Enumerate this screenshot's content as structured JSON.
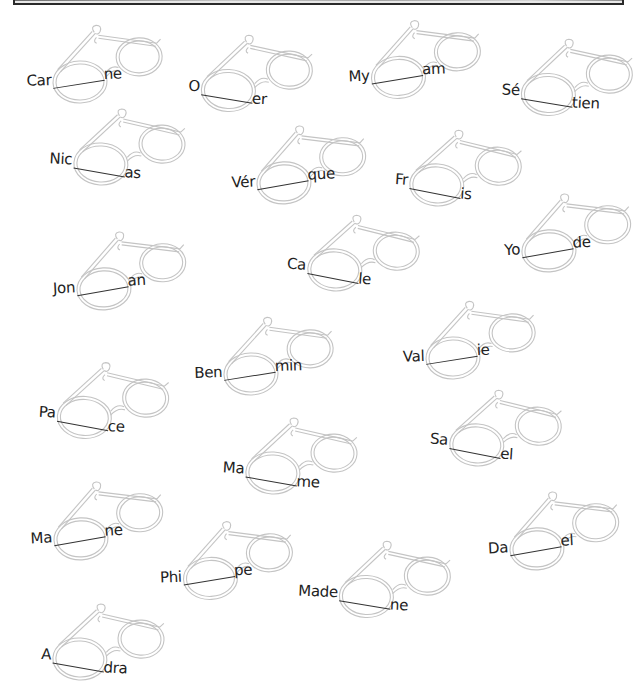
{
  "worksheet": {
    "header_bar": "decorative-title-bar",
    "items": [
      {
        "prefix": "Car",
        "suffix": "ne",
        "x": 22,
        "y": 48,
        "rot": -4
      },
      {
        "prefix": "O",
        "suffix": "er",
        "x": 175,
        "y": 52,
        "rot": 5
      },
      {
        "prefix": "My",
        "suffix": "am",
        "x": 340,
        "y": 44,
        "rot": -5
      },
      {
        "prefix": "Sé",
        "suffix": "tien",
        "x": 495,
        "y": 56,
        "rot": 5
      },
      {
        "prefix": "Nic",
        "suffix": "as",
        "x": 48,
        "y": 125,
        "rot": 6
      },
      {
        "prefix": "Vér",
        "suffix": "que",
        "x": 225,
        "y": 150,
        "rot": -6
      },
      {
        "prefix": "Fr",
        "suffix": "is",
        "x": 385,
        "y": 145,
        "rot": 8
      },
      {
        "prefix": "Jon",
        "suffix": "an",
        "x": 45,
        "y": 256,
        "rot": -6
      },
      {
        "prefix": "Ca",
        "suffix": "le",
        "x": 283,
        "y": 230,
        "rot": 8
      },
      {
        "prefix": "Yo",
        "suffix": "de",
        "x": 490,
        "y": 218,
        "rot": -6
      },
      {
        "prefix": "Ben",
        "suffix": "min",
        "x": 193,
        "y": 340,
        "rot": -4
      },
      {
        "prefix": "Val",
        "suffix": "ie",
        "x": 395,
        "y": 324,
        "rot": -4
      },
      {
        "prefix": "Pa",
        "suffix": "ce",
        "x": 32,
        "y": 378,
        "rot": 7
      },
      {
        "prefix": "Sa",
        "suffix": "el",
        "x": 425,
        "y": 405,
        "rot": 8
      },
      {
        "prefix": "Ma",
        "suffix": "me",
        "x": 220,
        "y": 434,
        "rot": 6
      },
      {
        "prefix": "Ma",
        "suffix": "ne",
        "x": 22,
        "y": 506,
        "rot": -6
      },
      {
        "prefix": "Da",
        "suffix": "el",
        "x": 478,
        "y": 516,
        "rot": -6
      },
      {
        "prefix": "Phi",
        "suffix": "pe",
        "x": 152,
        "y": 545,
        "rot": -5
      },
      {
        "prefix": "Made",
        "suffix": "ne",
        "x": 313,
        "y": 558,
        "rot": 5
      },
      {
        "prefix": "A",
        "suffix": "dra",
        "x": 27,
        "y": 620,
        "rot": 6
      }
    ]
  },
  "colors": {
    "text": "#222222",
    "glasses_outline": "#bdbdbd",
    "blank_line": "#333333"
  }
}
